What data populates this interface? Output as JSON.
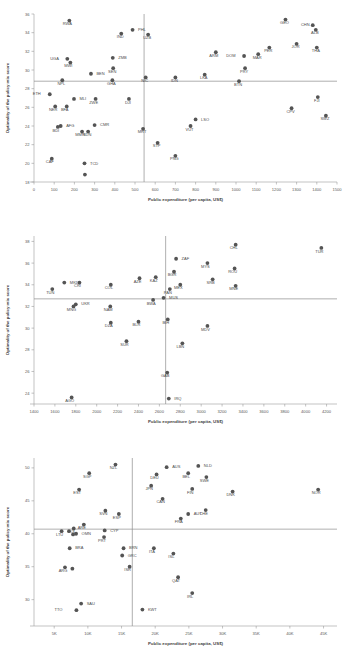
{
  "figure": {
    "width": 347,
    "height": 666,
    "panel_count": 3,
    "marker_color": "#545454",
    "axis_color": "#9a9a9a",
    "ref_line_color": "#8d8d8d"
  },
  "chart_data": [
    {
      "type": "scatter",
      "panel_index": 1,
      "title": "",
      "xlabel": "Public expenditure (per capita, US$)",
      "ylabel": "Optimality of the policy mix score",
      "xlim": [
        0,
        1500
      ],
      "ylim": [
        18,
        36
      ],
      "xticks": [
        0,
        100,
        200,
        300,
        400,
        500,
        600,
        700,
        800,
        900,
        1000,
        1100,
        1200,
        1300,
        1400,
        1500
      ],
      "xticklabels": [
        "0",
        "100",
        "200",
        "300",
        "400",
        "500",
        "600",
        "700",
        "800",
        "900",
        "1000",
        "1100",
        "1200",
        "1300",
        "1400",
        "1500"
      ],
      "yticks": [
        18,
        20,
        22,
        24,
        26,
        28,
        30,
        32,
        34,
        36
      ],
      "yticklabels": [
        "18",
        "20",
        "22",
        "24",
        "26",
        "28",
        "30",
        "32",
        "34",
        "36"
      ],
      "grid": false,
      "legend": "none",
      "hline": 28.8,
      "vline": 545,
      "points": [
        {
          "label": "RWA",
          "x": 175,
          "y": 35.3,
          "lx": -2,
          "ly": 4.6
        },
        {
          "label": "PHL",
          "x": 488,
          "y": 34.3,
          "lx": 5.5,
          "ly": 1.2
        },
        {
          "label": "IND",
          "x": 432,
          "y": 33.9,
          "lx": -1,
          "ly": 4.6
        },
        {
          "label": "UZB",
          "x": 565,
          "y": 33.8,
          "lx": -1,
          "ly": 4.6
        },
        {
          "label": "GEO",
          "x": 1245,
          "y": 35.4,
          "lx": -1,
          "ly": 4.6
        },
        {
          "label": "CHN",
          "x": 1380,
          "y": 34.8,
          "lx": -7.5,
          "ly": 1.2
        },
        {
          "label": "ALB",
          "x": 1395,
          "y": 34.3,
          "lx": -1,
          "ly": 4.6
        },
        {
          "label": "UGA",
          "x": 165,
          "y": 31.2,
          "lx": -8.5,
          "ly": 1.2
        },
        {
          "label": "MWI",
          "x": 180,
          "y": 30.8,
          "lx": -2,
          "ly": 4.6
        },
        {
          "label": "ZMB",
          "x": 390,
          "y": 31.3,
          "lx": 5.5,
          "ly": 1.2
        },
        {
          "label": "SEN",
          "x": 392,
          "y": 30.2,
          "lx": -1,
          "ly": 4.6
        },
        {
          "label": "ARM",
          "x": 900,
          "y": 31.9,
          "lx": -2,
          "ly": 4.6
        },
        {
          "label": "DOM",
          "x": 1040,
          "y": 31.5,
          "lx": -8.5,
          "ly": 1.2
        },
        {
          "label": "PER",
          "x": 1165,
          "y": 32.4,
          "lx": -1,
          "ly": 4.6
        },
        {
          "label": "JOR",
          "x": 1300,
          "y": 32.8,
          "lx": -1,
          "ly": 4.6
        },
        {
          "label": "THA",
          "x": 1400,
          "y": 32.4,
          "lx": -1,
          "ly": 4.6
        },
        {
          "label": "MAR",
          "x": 1110,
          "y": 31.7,
          "lx": -1,
          "ly": 4.6
        },
        {
          "label": "PRY",
          "x": 1045,
          "y": 30.2,
          "lx": -1,
          "ly": 4.6
        },
        {
          "label": "LKA",
          "x": 845,
          "y": 29.5,
          "lx": -1,
          "ly": 4.6
        },
        {
          "label": "GHA",
          "x": 388,
          "y": 28.9,
          "lx": -1,
          "ly": 4.6
        },
        {
          "label": "NPL",
          "x": 140,
          "y": 28.9,
          "lx": -1,
          "ly": 4.6
        },
        {
          "label": "BEN",
          "x": 282,
          "y": 29.6,
          "lx": 5.5,
          "ly": 1.2
        },
        {
          "label": "NIC",
          "x": 553,
          "y": 29.2,
          "lx": -1,
          "ly": 4.6
        },
        {
          "label": "IDN",
          "x": 700,
          "y": 29.2,
          "lx": -1,
          "ly": 4.6
        },
        {
          "label": "BTN",
          "x": 1015,
          "y": 28.8,
          "lx": -1,
          "ly": 4.6
        },
        {
          "label": "ETH",
          "x": 78,
          "y": 27.4,
          "lx": -9,
          "ly": 1.2
        },
        {
          "label": "MLI",
          "x": 198,
          "y": 26.9,
          "lx": 5.5,
          "ly": 1.2
        },
        {
          "label": "NER",
          "x": 105,
          "y": 26.1,
          "lx": -2,
          "ly": 4.6
        },
        {
          "label": "BFA",
          "x": 162,
          "y": 26.1,
          "lx": -2,
          "ly": 4.6
        },
        {
          "label": "ZWE",
          "x": 305,
          "y": 26.9,
          "lx": -2,
          "ly": 4.6
        },
        {
          "label": "DJI",
          "x": 470,
          "y": 26.9,
          "lx": -1,
          "ly": 4.6
        },
        {
          "label": "FJI",
          "x": 1405,
          "y": 27.1,
          "lx": -1,
          "ly": 4.6
        },
        {
          "label": "CPV",
          "x": 1275,
          "y": 25.9,
          "lx": -1,
          "ly": 4.6
        },
        {
          "label": "SWZ",
          "x": 1445,
          "y": 25.1,
          "lx": -1,
          "ly": 4.6
        },
        {
          "label": "LSO",
          "x": 800,
          "y": 24.7,
          "lx": 5.5,
          "ly": 1.2
        },
        {
          "label": "VUT",
          "x": 775,
          "y": 24.0,
          "lx": -1,
          "ly": 4.6
        },
        {
          "label": "AFG",
          "x": 132,
          "y": 24.0,
          "lx": 5.5,
          "ly": 1.2
        },
        {
          "label": "CMR",
          "x": 300,
          "y": 24.1,
          "lx": 5.5,
          "ly": 1.2
        },
        {
          "label": "BDI",
          "x": 118,
          "y": 23.9,
          "lx": -2,
          "ly": 4.6
        },
        {
          "label": "MMR",
          "x": 238,
          "y": 23.4,
          "lx": -2,
          "ly": 4.6
        },
        {
          "label": "SDN",
          "x": 268,
          "y": 23.4,
          "lx": -1,
          "ly": 4.6
        },
        {
          "label": "MRT",
          "x": 540,
          "y": 23.7,
          "lx": -1,
          "ly": 4.6
        },
        {
          "label": "STP",
          "x": 612,
          "y": 22.2,
          "lx": -1,
          "ly": 4.6
        },
        {
          "label": "PNG",
          "x": 700,
          "y": 20.8,
          "lx": -1,
          "ly": 4.6
        },
        {
          "label": "CAF",
          "x": 88,
          "y": 20.5,
          "lx": -2,
          "ly": 4.6
        },
        {
          "label": "TCD",
          "x": 250,
          "y": 20.0,
          "lx": 5.5,
          "ly": 1.2
        },
        {
          "label": "",
          "x": 252,
          "y": 18.8,
          "lx": 0,
          "ly": 0
        }
      ]
    },
    {
      "type": "scatter",
      "panel_index": 2,
      "title": "",
      "xlabel": "Public expenditure (per capita, US$)",
      "ylabel": "Optimality of the policy mix score",
      "xlim": [
        1400,
        4300
      ],
      "ylim": [
        23,
        38.5
      ],
      "xticks": [
        1400,
        1600,
        1800,
        2000,
        2200,
        2400,
        2600,
        2800,
        3000,
        3200,
        3400,
        3600,
        3800,
        4000,
        4200
      ],
      "xticklabels": [
        "1400",
        "1600",
        "1800",
        "2000",
        "2200",
        "2400",
        "2600",
        "2800",
        "3000",
        "3200",
        "3400",
        "3600",
        "3800",
        "4000",
        "4200"
      ],
      "yticks": [
        24,
        26,
        28,
        30,
        32,
        34,
        36,
        38
      ],
      "yticklabels": [
        "24",
        "26",
        "28",
        "30",
        "32",
        "34",
        "36",
        "38"
      ],
      "grid": false,
      "legend": "none",
      "hline": 32.7,
      "vline": 2660,
      "points": [
        {
          "label": "CHL",
          "x": 3330,
          "y": 37.7,
          "lx": -2,
          "ly": 4.6
        },
        {
          "label": "TUR",
          "x": 4150,
          "y": 37.4,
          "lx": -2,
          "ly": 4.6
        },
        {
          "label": "ZAF",
          "x": 2760,
          "y": 36.4,
          "lx": 5.5,
          "ly": 1.2
        },
        {
          "label": "MYS",
          "x": 3060,
          "y": 36.0,
          "lx": -2,
          "ly": 4.6
        },
        {
          "label": "ROU",
          "x": 3320,
          "y": 35.5,
          "lx": -2,
          "ly": 4.6
        },
        {
          "label": "BGR",
          "x": 2740,
          "y": 35.2,
          "lx": -2,
          "ly": 4.6
        },
        {
          "label": "AZE",
          "x": 2410,
          "y": 34.6,
          "lx": -2,
          "ly": 4.6
        },
        {
          "label": "KAZ",
          "x": 2565,
          "y": 34.7,
          "lx": -2,
          "ly": 4.6
        },
        {
          "label": "SRB",
          "x": 3110,
          "y": 34.5,
          "lx": -2,
          "ly": 4.6
        },
        {
          "label": "MKD",
          "x": 1690,
          "y": 34.2,
          "lx": 5.5,
          "ly": 1.2
        },
        {
          "label": "CRI",
          "x": 1835,
          "y": 34.2,
          "lx": -2,
          "ly": 4.6
        },
        {
          "label": "COL",
          "x": 2135,
          "y": 34.0,
          "lx": -2,
          "ly": 4.6
        },
        {
          "label": "MEX",
          "x": 2800,
          "y": 34.0,
          "lx": -2,
          "ly": 4.6
        },
        {
          "label": "MNE",
          "x": 3330,
          "y": 33.9,
          "lx": -2,
          "ly": 4.6
        },
        {
          "label": "PAN",
          "x": 2700,
          "y": 33.6,
          "lx": -2,
          "ly": 4.6
        },
        {
          "label": "TUN",
          "x": 1575,
          "y": 33.6,
          "lx": -2,
          "ly": 4.6
        },
        {
          "label": "MUS",
          "x": 2640,
          "y": 32.8,
          "lx": 5.5,
          "ly": 1.2
        },
        {
          "label": "BWA",
          "x": 2540,
          "y": 32.6,
          "lx": -2,
          "ly": 4.6
        },
        {
          "label": "UKR",
          "x": 1800,
          "y": 32.2,
          "lx": 5.5,
          "ly": 1.2
        },
        {
          "label": "MNG",
          "x": 1778,
          "y": 32.0,
          "lx": -2,
          "ly": 4.6
        },
        {
          "label": "NAM",
          "x": 2130,
          "y": 32.0,
          "lx": -2,
          "ly": 4.6
        },
        {
          "label": "BIH",
          "x": 2680,
          "y": 30.8,
          "lx": -2,
          "ly": 4.6
        },
        {
          "label": "DZA",
          "x": 2135,
          "y": 30.5,
          "lx": -2,
          "ly": 4.6
        },
        {
          "label": "BLR",
          "x": 2400,
          "y": 30.6,
          "lx": -2,
          "ly": 4.6
        },
        {
          "label": "MDV",
          "x": 3060,
          "y": 30.2,
          "lx": -2,
          "ly": 4.6
        },
        {
          "label": "SUR",
          "x": 2285,
          "y": 28.8,
          "lx": -2,
          "ly": 4.6
        },
        {
          "label": "LBN",
          "x": 2820,
          "y": 28.6,
          "lx": -2,
          "ly": 4.6
        },
        {
          "label": "GAB",
          "x": 2675,
          "y": 25.9,
          "lx": -2,
          "ly": 4.6
        },
        {
          "label": "AGO",
          "x": 1760,
          "y": 23.6,
          "lx": -2,
          "ly": 4.6
        },
        {
          "label": "IRQ",
          "x": 2690,
          "y": 23.5,
          "lx": 5.5,
          "ly": 1.2
        }
      ]
    },
    {
      "type": "scatter",
      "panel_index": 3,
      "title": "",
      "xlabel": "Public expenditure (per capita, US$)",
      "ylabel": "Optimality of the policy mix score",
      "xlim": [
        2000,
        47000
      ],
      "ylim": [
        26,
        51.5
      ],
      "xticks": [
        5000,
        10000,
        15000,
        20000,
        25000,
        30000,
        35000,
        40000,
        45000
      ],
      "xticklabels": [
        "5K",
        "10K",
        "15K",
        "20K",
        "25K",
        "30K",
        "35K",
        "40K",
        "45K"
      ],
      "yticks": [
        30,
        35,
        40,
        45,
        50
      ],
      "yticklabels": [
        "30",
        "35",
        "40",
        "45",
        "50"
      ],
      "grid": false,
      "legend": "none",
      "hline": 40.7,
      "vline": 16600,
      "points": [
        {
          "label": "NZL",
          "x": 14100,
          "y": 50.5,
          "lx": -2,
          "ly": 4.6
        },
        {
          "label": "AUS",
          "x": 21700,
          "y": 50.1,
          "lx": 5.5,
          "ly": 1.2
        },
        {
          "label": "NLD",
          "x": 26400,
          "y": 50.3,
          "lx": 5.5,
          "ly": 1.2
        },
        {
          "label": "SGP",
          "x": 10200,
          "y": 49.2,
          "lx": -2,
          "ly": 4.6
        },
        {
          "label": "DEU",
          "x": 20200,
          "y": 49.0,
          "lx": -2,
          "ly": 4.6
        },
        {
          "label": "BEL",
          "x": 24900,
          "y": 49.2,
          "lx": -2,
          "ly": 4.6
        },
        {
          "label": "SWE",
          "x": 27600,
          "y": 48.6,
          "lx": -2,
          "ly": 4.6
        },
        {
          "label": "EST",
          "x": 8700,
          "y": 46.7,
          "lx": -2,
          "ly": 4.6
        },
        {
          "label": "JPN",
          "x": 19400,
          "y": 47.3,
          "lx": -2,
          "ly": 4.6
        },
        {
          "label": "FIN",
          "x": 25500,
          "y": 46.8,
          "lx": -2,
          "ly": 4.6
        },
        {
          "label": "DNK",
          "x": 31500,
          "y": 46.4,
          "lx": -2,
          "ly": 4.6
        },
        {
          "label": "NOR",
          "x": 44200,
          "y": 46.7,
          "lx": -2,
          "ly": 4.6
        },
        {
          "label": "CAN",
          "x": 21100,
          "y": 45.3,
          "lx": -2,
          "ly": 4.6
        },
        {
          "label": "SVN",
          "x": 12600,
          "y": 43.5,
          "lx": -2,
          "ly": 4.6
        },
        {
          "label": "ESP",
          "x": 14600,
          "y": 43.0,
          "lx": -2,
          "ly": 4.6
        },
        {
          "label": "CHE",
          "x": 27500,
          "y": 43.6,
          "lx": -2,
          "ly": 4.6
        },
        {
          "label": "AUT",
          "x": 24900,
          "y": 43.0,
          "lx": 5.5,
          "ly": 1.2
        },
        {
          "label": "FRA",
          "x": 23800,
          "y": 42.3,
          "lx": -2,
          "ly": 4.6
        },
        {
          "label": "ARE",
          "x": 9400,
          "y": 41.4,
          "lx": -2,
          "ly": 4.6
        },
        {
          "label": "POL",
          "x": 7900,
          "y": 40.8,
          "lx": -2,
          "ly": 4.6
        },
        {
          "label": "CYP",
          "x": 12500,
          "y": 40.5,
          "lx": 5.5,
          "ly": 1.2
        },
        {
          "label": "LTU",
          "x": 6100,
          "y": 40.4,
          "lx": -2,
          "ly": 4.6
        },
        {
          "label": "OMN",
          "x": 8250,
          "y": 40.0,
          "lx": 5.5,
          "ly": 1.2
        },
        {
          "label": "PRT",
          "x": 12400,
          "y": 39.5,
          "lx": -2,
          "ly": 4.6
        },
        {
          "label": "BRA",
          "x": 7300,
          "y": 37.8,
          "lx": 5.5,
          "ly": 1.2
        },
        {
          "label": "BRN",
          "x": 15300,
          "y": 37.8,
          "lx": 5.5,
          "ly": 1.2
        },
        {
          "label": "ITA",
          "x": 19800,
          "y": 37.8,
          "lx": -2,
          "ly": 4.6
        },
        {
          "label": "ISL",
          "x": 22700,
          "y": 37.0,
          "lx": -2,
          "ly": 4.6
        },
        {
          "label": "GRC",
          "x": 15100,
          "y": 36.7,
          "lx": 5.5,
          "ly": 1.2
        },
        {
          "label": "ARG",
          "x": 6600,
          "y": 34.9,
          "lx": -2,
          "ly": 4.6
        },
        {
          "label": "ISR",
          "x": 16200,
          "y": 35.0,
          "lx": -2,
          "ly": 4.6
        },
        {
          "label": "QAT",
          "x": 23400,
          "y": 33.4,
          "lx": -2,
          "ly": 4.6
        },
        {
          "label": "IRL",
          "x": 25500,
          "y": 31.0,
          "lx": -2,
          "ly": 4.6
        },
        {
          "label": "SAU",
          "x": 9000,
          "y": 29.4,
          "lx": 5.5,
          "ly": 1.2
        },
        {
          "label": "TTO",
          "x": 8300,
          "y": 28.4,
          "lx": -14,
          "ly": 1.2
        },
        {
          "label": "KWT",
          "x": 18100,
          "y": 28.5,
          "lx": 5.5,
          "ly": 1.2
        },
        {
          "label": "",
          "x": 7700,
          "y": 34.7,
          "lx": 0,
          "ly": 0
        },
        {
          "label": "",
          "x": 7200,
          "y": 40.4,
          "lx": 0,
          "ly": 0
        },
        {
          "label": "",
          "x": 7800,
          "y": 39.9,
          "lx": 0,
          "ly": 0
        }
      ]
    }
  ]
}
